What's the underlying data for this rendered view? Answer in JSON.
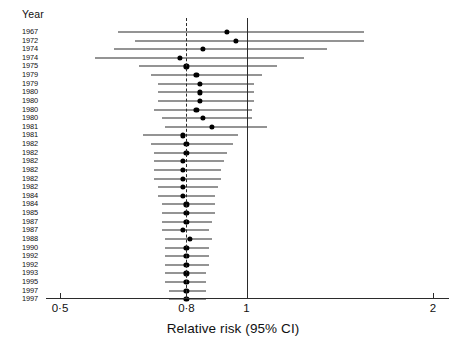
{
  "figure": {
    "row_header": "Year",
    "axis_title": "Relative risk (95% CI)",
    "axis_ticks": [
      {
        "label": "0·5",
        "value": 0.5
      },
      {
        "label": "0·8",
        "value": 0.8
      },
      {
        "label": "1",
        "value": 1.0
      },
      {
        "label": "2",
        "value": 2.0
      }
    ],
    "reference_lines": [
      {
        "name": "pooled-estimate-line",
        "value": 0.8,
        "style": "dashed"
      },
      {
        "name": "null-effect-line",
        "value": 1.0,
        "style": "solid"
      }
    ],
    "colors": {
      "marker": "#000000",
      "line": "#2b2b2b",
      "text": "#111111",
      "background": "#ffffff"
    }
  },
  "chart_data": {
    "type": "scatter",
    "subtype": "forest-plot",
    "title": "",
    "xlabel": "Relative risk (95% CI)",
    "ylabel": "Year",
    "xscale": "log",
    "xlim": [
      0.5,
      2.0
    ],
    "xticks": [
      0.5,
      0.8,
      1.0,
      2.0
    ],
    "xticklabels": [
      "0·5",
      "0·8",
      "1",
      "2"
    ],
    "grid": false,
    "legend": "none",
    "categories": [
      "1967",
      "1972",
      "1974",
      "1974",
      "1975",
      "1979",
      "1979",
      "1980",
      "1980",
      "1980",
      "1980",
      "1981",
      "1981",
      "1982",
      "1982",
      "1982",
      "1982",
      "1982",
      "1982",
      "1984",
      "1984",
      "1985",
      "1987",
      "1987",
      "1988",
      "1990",
      "1992",
      "1992",
      "1993",
      "1995",
      "1997",
      "1997"
    ],
    "studies": [
      {
        "year": "1967",
        "rr": 0.93,
        "lcl": 0.62,
        "ucl": 1.55
      },
      {
        "year": "1972",
        "rr": 0.96,
        "lcl": 0.66,
        "ucl": 1.55
      },
      {
        "year": "1974",
        "rr": 0.85,
        "lcl": 0.61,
        "ucl": 1.35
      },
      {
        "year": "1974",
        "rr": 0.78,
        "lcl": 0.57,
        "ucl": 1.24
      },
      {
        "year": "1975",
        "rr": 0.8,
        "lcl": 0.67,
        "ucl": 1.12
      },
      {
        "year": "1979",
        "rr": 0.83,
        "lcl": 0.7,
        "ucl": 1.06
      },
      {
        "year": "1979",
        "rr": 0.84,
        "lcl": 0.72,
        "ucl": 1.03
      },
      {
        "year": "1980",
        "rr": 0.84,
        "lcl": 0.72,
        "ucl": 1.03
      },
      {
        "year": "1980",
        "rr": 0.84,
        "lcl": 0.72,
        "ucl": 1.03
      },
      {
        "year": "1980",
        "rr": 0.83,
        "lcl": 0.71,
        "ucl": 1.02
      },
      {
        "year": "1980",
        "rr": 0.85,
        "lcl": 0.73,
        "ucl": 1.02
      },
      {
        "year": "1981",
        "rr": 0.88,
        "lcl": 0.74,
        "ucl": 1.08
      },
      {
        "year": "1981",
        "rr": 0.79,
        "lcl": 0.68,
        "ucl": 0.97
      },
      {
        "year": "1982",
        "rr": 0.8,
        "lcl": 0.7,
        "ucl": 0.95
      },
      {
        "year": "1982",
        "rr": 0.8,
        "lcl": 0.71,
        "ucl": 0.93
      },
      {
        "year": "1982",
        "rr": 0.79,
        "lcl": 0.71,
        "ucl": 0.92
      },
      {
        "year": "1982",
        "rr": 0.79,
        "lcl": 0.71,
        "ucl": 0.91
      },
      {
        "year": "1982",
        "rr": 0.79,
        "lcl": 0.71,
        "ucl": 0.91
      },
      {
        "year": "1982",
        "rr": 0.79,
        "lcl": 0.72,
        "ucl": 0.9
      },
      {
        "year": "1984",
        "rr": 0.79,
        "lcl": 0.72,
        "ucl": 0.89
      },
      {
        "year": "1984",
        "rr": 0.8,
        "lcl": 0.73,
        "ucl": 0.89
      },
      {
        "year": "1985",
        "rr": 0.8,
        "lcl": 0.73,
        "ucl": 0.89
      },
      {
        "year": "1987",
        "rr": 0.8,
        "lcl": 0.73,
        "ucl": 0.88
      },
      {
        "year": "1987",
        "rr": 0.79,
        "lcl": 0.73,
        "ucl": 0.87
      },
      {
        "year": "1988",
        "rr": 0.81,
        "lcl": 0.74,
        "ucl": 0.88
      },
      {
        "year": "1990",
        "rr": 0.8,
        "lcl": 0.74,
        "ucl": 0.87
      },
      {
        "year": "1992",
        "rr": 0.8,
        "lcl": 0.74,
        "ucl": 0.87
      },
      {
        "year": "1992",
        "rr": 0.8,
        "lcl": 0.74,
        "ucl": 0.87
      },
      {
        "year": "1993",
        "rr": 0.8,
        "lcl": 0.74,
        "ucl": 0.86
      },
      {
        "year": "1995",
        "rr": 0.8,
        "lcl": 0.74,
        "ucl": 0.86
      },
      {
        "year": "1997",
        "rr": 0.8,
        "lcl": 0.75,
        "ucl": 0.86
      },
      {
        "year": "1997",
        "rr": 0.8,
        "lcl": 0.75,
        "ucl": 0.86
      }
    ]
  }
}
